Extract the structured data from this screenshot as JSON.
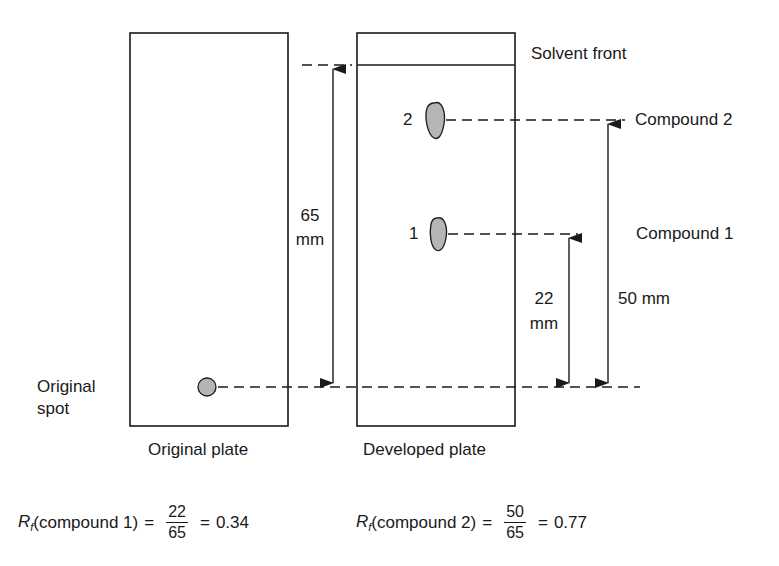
{
  "diagram": {
    "plates": {
      "original": {
        "caption": "Original plate"
      },
      "developed": {
        "caption": "Developed plate"
      }
    },
    "labels": {
      "solvent_front": "Solvent front",
      "compound_2": "Compound 2",
      "compound_1": "Compound 1",
      "original_spot_line1": "Original",
      "original_spot_line2": "spot",
      "spot_2_number": "2",
      "spot_1_number": "1"
    },
    "measurements": {
      "solvent_distance_value": "65",
      "solvent_distance_unit": "mm",
      "compound1_distance_value": "22",
      "compound1_distance_unit": "mm",
      "compound2_distance": "50 mm"
    },
    "formulas": [
      {
        "symbol": "R",
        "subscript": "f",
        "subject": "(compound 1)",
        "numerator": "22",
        "denominator": "65",
        "result": "0.34"
      },
      {
        "symbol": "R",
        "subscript": "f",
        "subject": "(compound 2)",
        "numerator": "50",
        "denominator": "65",
        "result": "0.77"
      }
    ],
    "equals_sign": "=",
    "colors": {
      "line": "#1a1a1a",
      "spot_fill": "#b5b5b5"
    }
  }
}
